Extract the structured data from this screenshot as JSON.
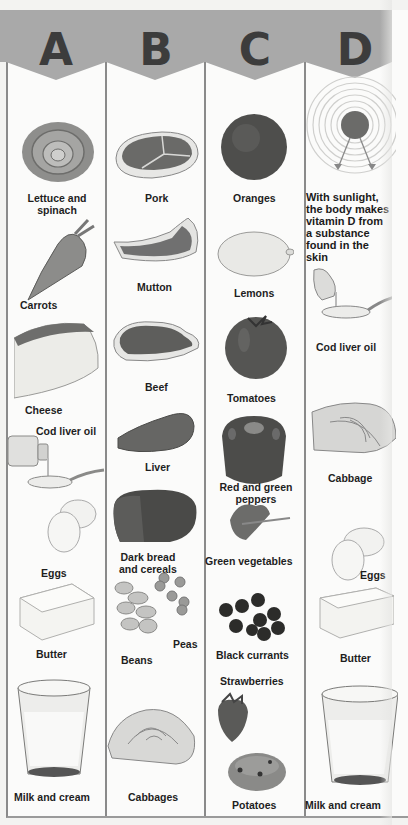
{
  "header": {
    "columns": [
      {
        "letter": "A"
      },
      {
        "letter": "B"
      },
      {
        "letter": "C"
      },
      {
        "letter": "D"
      }
    ]
  },
  "colors": {
    "header_band": "#a9a9a9",
    "letter": "#3c3c3c",
    "divider": "#8a8a8a",
    "background": "#fbfbfa"
  },
  "column_a": {
    "items": [
      {
        "label": "Lettuce and\nspinach",
        "icon": "lettuce-icon"
      },
      {
        "label": "Carrots",
        "icon": "carrot-icon"
      },
      {
        "label": "Cheese",
        "icon": "cheese-icon"
      },
      {
        "label": "Cod liver oil",
        "icon": "cod-liver-oil-icon"
      },
      {
        "label": "Eggs",
        "icon": "eggs-icon"
      },
      {
        "label": "Butter",
        "icon": "butter-icon"
      },
      {
        "label": "Milk and cream",
        "icon": "milk-glass-icon"
      }
    ]
  },
  "column_b": {
    "items": [
      {
        "label": "Pork",
        "icon": "pork-icon"
      },
      {
        "label": "Mutton",
        "icon": "mutton-icon"
      },
      {
        "label": "Beef",
        "icon": "beef-icon"
      },
      {
        "label": "Liver",
        "icon": "liver-icon"
      },
      {
        "label": "Dark bread\nand cereals",
        "icon": "bread-icon"
      },
      {
        "label": "Peas",
        "icon": "peas-icon"
      },
      {
        "label": "Beans",
        "icon": "beans-icon"
      },
      {
        "label": "Cabbages",
        "icon": "cabbage-icon"
      }
    ]
  },
  "column_c": {
    "items": [
      {
        "label": "Oranges",
        "icon": "orange-icon"
      },
      {
        "label": "Lemons",
        "icon": "lemon-icon"
      },
      {
        "label": "Tomatoes",
        "icon": "tomato-icon"
      },
      {
        "label": "Red and green\npeppers",
        "icon": "pepper-icon"
      },
      {
        "label": "Green vegetables",
        "icon": "greens-icon"
      },
      {
        "label": "Black currants",
        "icon": "black-currants-icon"
      },
      {
        "label": "Strawberries",
        "icon": "strawberry-icon"
      },
      {
        "label": "Potatoes",
        "icon": "potato-icon"
      }
    ]
  },
  "column_d": {
    "note": "With sunlight,\nthe body makes\nvitamin D from\na substance\nfound in the\nskin",
    "items": [
      {
        "label": "Cod liver oil",
        "icon": "cod-liver-oil-icon"
      },
      {
        "label": "Cabbage",
        "icon": "cabbage-icon"
      },
      {
        "label": "Eggs",
        "icon": "eggs-icon"
      },
      {
        "label": "Butter",
        "icon": "butter-icon"
      },
      {
        "label": "Milk and cream",
        "icon": "milk-glass-icon"
      }
    ]
  }
}
